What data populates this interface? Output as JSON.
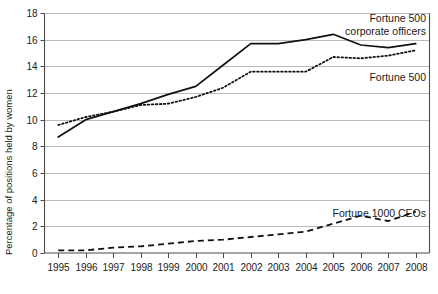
{
  "chart_data": {
    "type": "line",
    "title": "",
    "xlabel": "",
    "ylabel": "Percentage of positions held by women",
    "ylim": [
      0,
      18
    ],
    "ytick_step": 2,
    "yticks": [
      "0",
      "2",
      "4",
      "6",
      "8",
      "10",
      "12",
      "14",
      "16",
      "18"
    ],
    "grid": true,
    "legend_position": "inline-annotations",
    "x": [
      1995,
      1996,
      1997,
      1998,
      1999,
      2000,
      2001,
      2002,
      2003,
      2004,
      2005,
      2006,
      2007,
      2008
    ],
    "categories": [
      "1995",
      "1996",
      "1997",
      "1998",
      "1999",
      "2000",
      "2001",
      "2002",
      "2003",
      "2004",
      "2005",
      "2006",
      "2007",
      "2008"
    ],
    "series": [
      {
        "name": "Fortune 500 corporate officers",
        "style": "solid",
        "values": [
          8.7,
          10.0,
          10.6,
          11.2,
          11.9,
          12.5,
          14.1,
          15.7,
          15.7,
          16.0,
          16.4,
          15.6,
          15.4,
          15.7
        ]
      },
      {
        "name": "Fortune 500 board members",
        "style": "dotted",
        "values": [
          9.6,
          10.2,
          10.6,
          11.1,
          11.2,
          11.7,
          12.4,
          13.6,
          13.6,
          13.6,
          14.7,
          14.6,
          14.8,
          15.2
        ]
      },
      {
        "name": "Fortune 1000 CEOs",
        "style": "dashed",
        "values": [
          0.2,
          0.2,
          0.4,
          0.5,
          0.7,
          0.9,
          1.0,
          1.2,
          1.4,
          1.6,
          2.2,
          2.8,
          2.4,
          3.1
        ]
      }
    ],
    "annotations": [
      {
        "id": "annot-corporate-officers",
        "line1": "Fortune 500",
        "line2": "corporate officers"
      },
      {
        "id": "annot-board-members",
        "line1": "Fortune 500",
        "line2": "board members"
      },
      {
        "id": "annot-ceos",
        "line1": "Fortune 1000 CEOs",
        "line2": ""
      }
    ]
  }
}
